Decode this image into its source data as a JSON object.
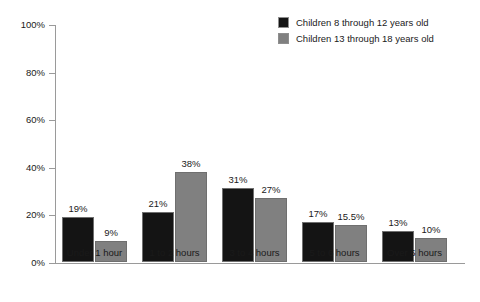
{
  "chart_data": {
    "type": "bar",
    "title": "",
    "subtitle": "",
    "xlabel": "",
    "ylabel": "",
    "ylim": [
      0,
      100
    ],
    "grid": false,
    "legend_position": "top-right",
    "categories": [
      "Under 1 hour",
      "1 to 2 hours",
      "3 to 4 hours",
      "5 to 6 hours",
      "Over 6 hours"
    ],
    "y_ticks": [
      "0%",
      "20%",
      "40%",
      "60%",
      "80%",
      "100%"
    ],
    "y_tick_values": [
      0,
      20,
      40,
      60,
      80,
      100
    ],
    "series": [
      {
        "name": "Children 8 through 12 years old",
        "color": "#141414",
        "values": [
          19,
          21,
          31,
          17,
          13
        ],
        "labels": [
          "19%",
          "21%",
          "31%",
          "17%",
          "13%"
        ]
      },
      {
        "name": "Children 13 through 18 years old",
        "color": "#808080",
        "values": [
          9,
          38,
          27,
          15.5,
          10
        ],
        "labels": [
          "9%",
          "38%",
          "27%",
          "15.5%",
          "10%"
        ]
      }
    ]
  },
  "legend": {
    "items": [
      {
        "label": "Children 8 through 12 years old",
        "color": "#141414"
      },
      {
        "label": "Children 13 through 18 years old",
        "color": "#808080"
      }
    ]
  },
  "colors": {
    "background": "#ffffff",
    "axis": "#9a9a9a",
    "text": "#1a1a1a",
    "series_0": "#141414",
    "series_1": "#808080"
  }
}
